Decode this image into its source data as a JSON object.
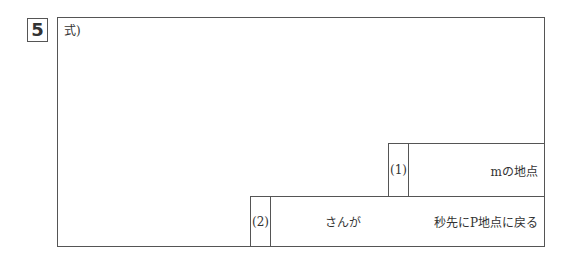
{
  "question_number": "5",
  "formula_label": "式)",
  "answers": [
    {
      "label": "(1)",
      "text": "mの地点"
    },
    {
      "label": "(2)",
      "text_middle": "さんが",
      "text_end": "秒先にP地点に戻る"
    }
  ]
}
